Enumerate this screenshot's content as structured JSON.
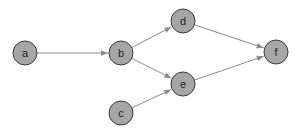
{
  "colors": {
    "node_fill": "#a6a6a6",
    "node_stroke": "#3a3a3a",
    "edge": "#8c8c8c"
  },
  "nodes": [
    {
      "id": "a",
      "label": "a",
      "x": 25,
      "y": 53
    },
    {
      "id": "b",
      "label": "b",
      "x": 121,
      "y": 53
    },
    {
      "id": "c",
      "label": "c",
      "x": 121,
      "y": 113
    },
    {
      "id": "d",
      "label": "d",
      "x": 183,
      "y": 21
    },
    {
      "id": "e",
      "label": "e",
      "x": 183,
      "y": 84
    },
    {
      "id": "f",
      "label": "f",
      "x": 276,
      "y": 52
    }
  ],
  "edges": [
    {
      "from": "a",
      "to": "b"
    },
    {
      "from": "b",
      "to": "d"
    },
    {
      "from": "b",
      "to": "e"
    },
    {
      "from": "c",
      "to": "e"
    },
    {
      "from": "d",
      "to": "f"
    },
    {
      "from": "e",
      "to": "f"
    }
  ]
}
